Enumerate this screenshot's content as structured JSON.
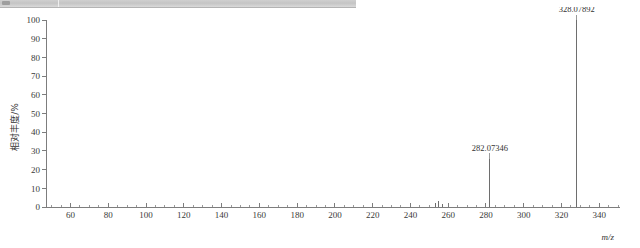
{
  "chrome": {
    "strip_label": "window-chrome-strip"
  },
  "chart_data": {
    "type": "bar",
    "title": "",
    "subtitle": "",
    "xlabel": "m/z",
    "ylabel": "相对丰度/%",
    "xlim": [
      47,
      351
    ],
    "ylim": [
      0,
      100
    ],
    "grid": false,
    "legend": null,
    "x_ticks": [
      60,
      80,
      100,
      120,
      140,
      160,
      180,
      200,
      220,
      240,
      260,
      280,
      300,
      320,
      340
    ],
    "x_tick_labels": [
      "60",
      "80",
      "100",
      "120",
      "140",
      "160",
      "180",
      "200",
      "220",
      "240",
      "260",
      "280",
      "300",
      "320",
      "340"
    ],
    "x_minor_step": 5,
    "y_ticks": [
      0,
      10,
      20,
      30,
      40,
      50,
      60,
      70,
      80,
      90,
      100
    ],
    "y_tick_labels": [
      "0",
      "10",
      "20",
      "30",
      "40",
      "50",
      "60",
      "70",
      "80",
      "90",
      "100"
    ],
    "series": [
      {
        "name": "mass spectrum",
        "x": [
          253.4,
          255.1,
          256.8,
          282.07346,
          328.07892
        ],
        "values": [
          2.0,
          3.2,
          1.6,
          25.7,
          100.0
        ]
      }
    ],
    "annotations": [
      {
        "text": "282.07346",
        "x": 282.07346,
        "y": 25.7,
        "label_offset_y": 7
      },
      {
        "text": "328.07892",
        "x": 328.07892,
        "y": 100.0,
        "label_offset_y": 7
      }
    ],
    "colors": {
      "peak": "#6e6e6e",
      "axis": "#7d7d7d",
      "text": "#333333",
      "background": "#ffffff"
    }
  }
}
